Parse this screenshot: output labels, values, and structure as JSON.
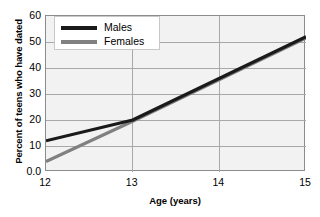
{
  "chart_data": {
    "type": "line",
    "title": "",
    "xlabel": "Age (years)",
    "ylabel": "Percent of teens who have dated",
    "xlim": [
      12,
      15
    ],
    "ylim": [
      0,
      60
    ],
    "grid": true,
    "legend_position": "upper left",
    "x": [
      12,
      13,
      15
    ],
    "xticks": [
      "12",
      "13",
      "14",
      "15"
    ],
    "xtick_values": [
      12,
      13,
      14,
      15
    ],
    "yticks": [
      "0.0",
      "10",
      "20",
      "30",
      "40",
      "50",
      "60"
    ],
    "ytick_values": [
      0,
      10,
      20,
      30,
      40,
      50,
      60
    ],
    "series": [
      {
        "name": "Males",
        "color": "#1a1a1a",
        "values": [
          12,
          20,
          52
        ]
      },
      {
        "name": "Females",
        "color": "#808080",
        "values": [
          4,
          19.5,
          51.5
        ]
      }
    ]
  },
  "legend": {
    "entries": [
      {
        "label": "Males",
        "color": "#1a1a1a"
      },
      {
        "label": "Females",
        "color": "#808080"
      }
    ]
  },
  "colors": {
    "plot_background": "#f2f2f2",
    "page_background": "#ffffff",
    "gridline": "#a8a8a8",
    "axis_border": "#8c8c8c",
    "males_line": "#1a1a1a",
    "females_line": "#808080"
  }
}
